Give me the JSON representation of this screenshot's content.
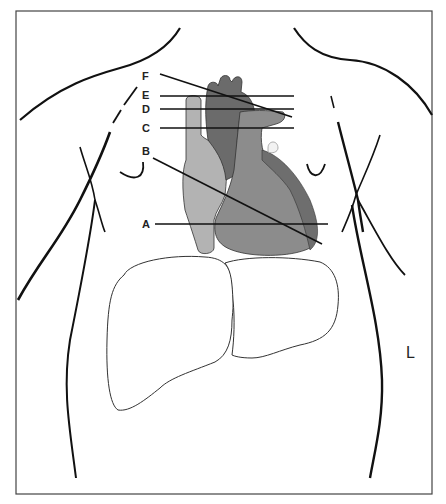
{
  "diagram": {
    "type": "anatomical-chest-diagram",
    "orientation_label": "L",
    "section_labels": [
      {
        "id": "F",
        "label": "F",
        "orientation": "oblique"
      },
      {
        "id": "E",
        "label": "E",
        "orientation": "horizontal"
      },
      {
        "id": "D",
        "label": "D",
        "orientation": "horizontal"
      },
      {
        "id": "C",
        "label": "C",
        "orientation": "horizontal"
      },
      {
        "id": "B",
        "label": "B",
        "orientation": "oblique"
      },
      {
        "id": "A",
        "label": "A",
        "orientation": "horizontal"
      }
    ],
    "structures": [
      "torso-outline",
      "clavicles",
      "nipples",
      "heart",
      "aorta",
      "superior-vena-cava",
      "pulmonary-artery",
      "liver"
    ],
    "colors": {
      "outline": "#111111",
      "heart_ventricle": "#8a8a8a",
      "heart_left_ventricle_edge": "#6e6e6e",
      "aorta": "#6a6a6a",
      "vena_cava": "#b0b0b0",
      "pulmonary_trunk": "#9a9a9a",
      "liver_fill": "#ffffff",
      "background": "#ffffff"
    }
  }
}
